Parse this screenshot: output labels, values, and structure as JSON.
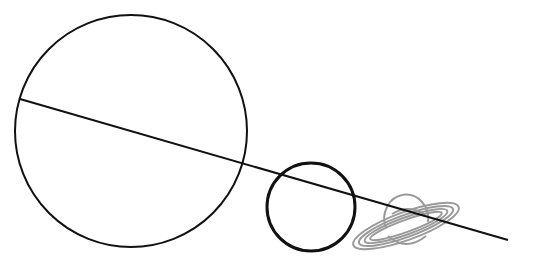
{
  "diagram": {
    "colors": {
      "outline": "#111111",
      "saturn": "#9a9a9a",
      "background": "#ffffff"
    },
    "objects": [
      {
        "id": "large-planet",
        "icon": "large-circle"
      },
      {
        "id": "medium-planet",
        "icon": "small-circle"
      },
      {
        "id": "saturn",
        "icon": "ringed-planet-icon"
      }
    ]
  }
}
